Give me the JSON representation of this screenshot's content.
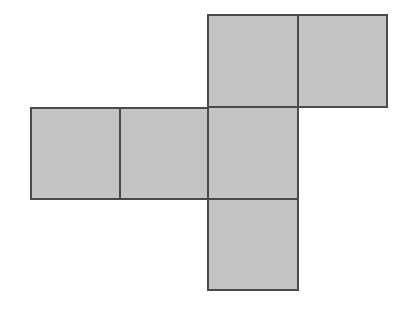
{
  "diagram": {
    "type": "cube-net",
    "face_count": 6,
    "fill_color": "#c4c4c4",
    "stroke_color": "#4a4a4a",
    "faces": [
      {
        "id": "top-center",
        "x": 207,
        "y": 14,
        "w": 92,
        "h": 94
      },
      {
        "id": "top-right",
        "x": 297,
        "y": 14,
        "w": 91,
        "h": 94
      },
      {
        "id": "middle-left",
        "x": 30,
        "y": 107,
        "w": 91,
        "h": 93
      },
      {
        "id": "middle-center-left",
        "x": 119,
        "y": 107,
        "w": 90,
        "h": 93
      },
      {
        "id": "middle-center",
        "x": 207,
        "y": 106,
        "w": 92,
        "h": 94
      },
      {
        "id": "bottom-center",
        "x": 207,
        "y": 198,
        "w": 92,
        "h": 93
      }
    ]
  }
}
